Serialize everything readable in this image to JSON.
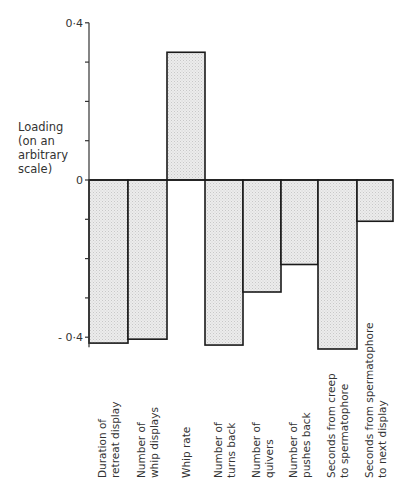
{
  "chart_data": {
    "type": "bar",
    "title": "",
    "xlabel": "",
    "ylabel": "Loading (on an arbitrary scale)",
    "ylabel_lines": [
      "Loading",
      "(on an",
      "arbitrary",
      "scale)"
    ],
    "ylim": [
      -0.4,
      0.4
    ],
    "yticks": [
      0.4,
      0.3,
      0.2,
      0.1,
      0,
      -0.1,
      -0.2,
      -0.3,
      -0.4
    ],
    "ytick_labels": {
      "0.4": "0·4",
      "0": "0",
      "-0.4": "- 0·4"
    },
    "grid": false,
    "legend": null,
    "categories": [
      [
        "Duration of",
        "retreat display"
      ],
      [
        "Number of",
        "whip displays"
      ],
      [
        "Whip rate"
      ],
      [
        "Number of",
        "turns back"
      ],
      [
        "Number of",
        "quivers"
      ],
      [
        "Number of",
        "pushes back"
      ],
      [
        "Seconds from creep",
        "to spermatophore"
      ],
      [
        "Seconds from spermatophore",
        "to next display"
      ]
    ],
    "values": [
      -0.415,
      -0.405,
      0.325,
      -0.42,
      -0.285,
      -0.215,
      -0.43,
      -0.105
    ],
    "bar_fill": "#e4e4e4",
    "bar_stroke": "#1a1a1a"
  }
}
